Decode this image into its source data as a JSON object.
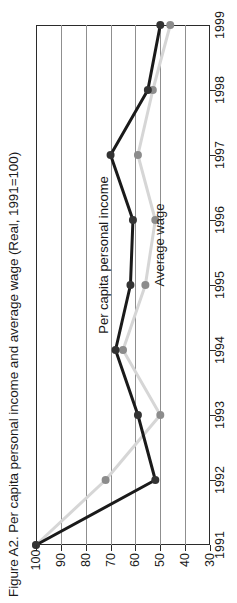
{
  "figure": {
    "title": "Figure A2.  Per capita personal income and average wage (Real, 1991=100)"
  },
  "annotations": {
    "income_label": "Per capita personal income",
    "wage_label": "Average wage"
  },
  "chart_data": {
    "type": "line",
    "title": "Figure A2.  Per capita personal income and average wage (Real, 1991=100)",
    "orientation": "rotated-90-ccw",
    "xlabel": "",
    "ylabel": "",
    "grid": true,
    "legend": "inline-annotations",
    "categories": [
      "1991",
      "1992",
      "1993",
      "1994",
      "1995",
      "1996",
      "1997",
      "1998",
      "1999"
    ],
    "value_ticks": [
      "100",
      "90",
      "80",
      "70",
      "60",
      "50",
      "40",
      "30"
    ],
    "value_tick_numbers": [
      100,
      90,
      80,
      70,
      60,
      50,
      40,
      30
    ],
    "ylim": [
      30,
      100
    ],
    "value_axis_direction": "descending-left-to-right",
    "series": [
      {
        "name": "Per capita personal income",
        "color": "#1a1a1a",
        "marker_color": "#333333",
        "values": [
          100,
          52,
          59,
          68,
          62,
          61,
          70,
          55,
          50
        ]
      },
      {
        "name": "Average wage",
        "color": "#d6d6d6",
        "marker_color": "#8c8c8c",
        "values": [
          100,
          72,
          50,
          65,
          56,
          52,
          59,
          53,
          46
        ]
      }
    ]
  }
}
